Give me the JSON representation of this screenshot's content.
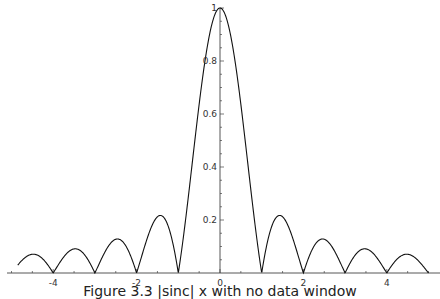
{
  "chart_data": {
    "type": "line",
    "title": "",
    "caption": "Figure 3.3  |sinc| x with no data window",
    "function": "|sin(pi x)/(pi x)|",
    "xlabel": "",
    "ylabel": "",
    "xlim": [
      -5,
      5
    ],
    "ylim": [
      0,
      1
    ],
    "x_ticks": [
      -4,
      -2,
      0,
      2,
      4
    ],
    "y_ticks": [
      0.2,
      0.4,
      0.6,
      0.8,
      1
    ],
    "x_tick_labels": [
      "-4",
      "-2",
      "0",
      "2",
      "4"
    ],
    "y_tick_labels": [
      "0.2",
      "0.4",
      "0.6",
      "0.8",
      "1"
    ],
    "grid": false,
    "legend": null,
    "series": [
      {
        "name": "abs sinc",
        "x": [
          -4.85,
          -4.5,
          -4,
          -3.5,
          -3,
          -2.5,
          -2,
          -1.5,
          -1,
          -0.5,
          0,
          0.5,
          1,
          1.5,
          2,
          2.5,
          3,
          3.5,
          4,
          4.5,
          5
        ],
        "values": [
          0.03,
          0.071,
          0,
          0.091,
          0,
          0.127,
          0,
          0.212,
          0,
          0.637,
          1,
          0.637,
          0,
          0.212,
          0,
          0.127,
          0,
          0.091,
          0,
          0.071,
          0
        ]
      }
    ],
    "zeros": [
      -4,
      -3,
      -2,
      -1,
      1,
      2,
      3,
      4,
      5
    ],
    "peaks": [
      {
        "x": 0,
        "y": 1
      },
      {
        "x": -1.43,
        "y": 0.217
      },
      {
        "x": 1.43,
        "y": 0.217
      },
      {
        "x": -2.46,
        "y": 0.128
      },
      {
        "x": 2.46,
        "y": 0.128
      },
      {
        "x": -3.47,
        "y": 0.091
      },
      {
        "x": 3.47,
        "y": 0.091
      },
      {
        "x": -4.48,
        "y": 0.071
      },
      {
        "x": 4.48,
        "y": 0.071
      }
    ]
  },
  "figure": {
    "caption": "Figure 3.3  |sinc| x with no data window"
  }
}
